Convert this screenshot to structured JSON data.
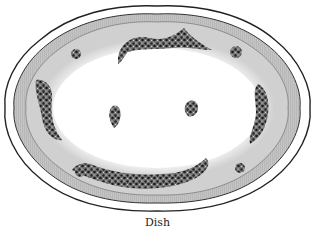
{
  "figure": {
    "caption": "Dish",
    "colors": {
      "outline": "#222222",
      "rim_band": "#b8b8b8",
      "rim_light": "#d4d4d4",
      "well": "#ffffff",
      "garland": "#3a3a3a"
    }
  }
}
